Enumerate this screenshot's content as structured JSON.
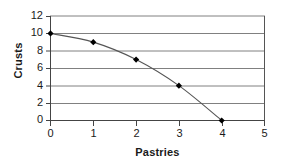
{
  "chart_data": {
    "type": "line",
    "title": "",
    "xlabel": "Pastries",
    "ylabel": "Crusts",
    "x": [
      0,
      1,
      2,
      3,
      4
    ],
    "values": [
      10,
      9,
      7,
      4,
      0
    ],
    "series": [
      {
        "name": "Crusts vs Pastries",
        "x": [
          0,
          1,
          2,
          3,
          4
        ],
        "values": [
          10,
          9,
          7,
          4,
          0
        ]
      }
    ],
    "xlim": [
      0,
      5
    ],
    "ylim": [
      0,
      12
    ],
    "xticks": [
      "0",
      "1",
      "2",
      "3",
      "4",
      "5"
    ],
    "yticks": [
      "0",
      "2",
      "4",
      "6",
      "8",
      "10",
      "12"
    ],
    "grid": "horizontal",
    "legend": "none",
    "marker": "diamond",
    "line_color": "#555555",
    "marker_color": "#000000",
    "grid_color": "#808080",
    "axis_color": "#444444",
    "smoothed": true
  }
}
